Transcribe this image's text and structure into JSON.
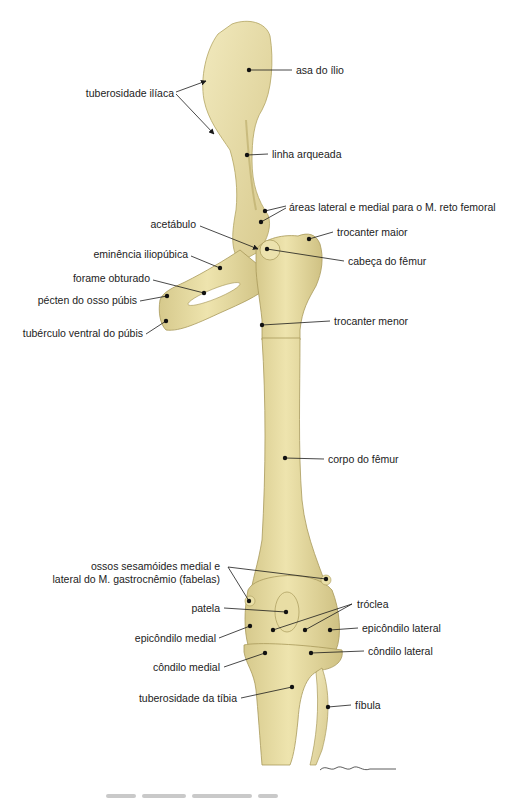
{
  "figure": {
    "colors": {
      "bone_fill": "#ebe0a6",
      "bone_shade": "#c8b978",
      "bone_edge": "#a8995a",
      "leader": "#1a1a1a",
      "text": "#222222",
      "background": "#ffffff"
    },
    "labels": [
      {
        "id": "asa-do-ilio",
        "text": "asa do ílio"
      },
      {
        "id": "tuberosidade-iliaca",
        "text": "tuberosidade ilíaca"
      },
      {
        "id": "linha-arqueada",
        "text": "linha arqueada"
      },
      {
        "id": "areas-reto-femoral",
        "text": "áreas lateral e medial para o M. reto femoral"
      },
      {
        "id": "acetabulo",
        "text": "acetábulo"
      },
      {
        "id": "trocanter-maior",
        "text": "trocanter maior"
      },
      {
        "id": "eminencia-iliopubica",
        "text": "eminência iliopúbica"
      },
      {
        "id": "cabeca-do-femur",
        "text": "cabeça do fêmur"
      },
      {
        "id": "forame-obturado",
        "text": "forame obturado"
      },
      {
        "id": "pecten-osso-pubis",
        "text": "pécten do osso púbis"
      },
      {
        "id": "tuberculo-ventral-pubis",
        "text": "tubérculo ventral do púbis"
      },
      {
        "id": "trocanter-menor",
        "text": "trocanter menor"
      },
      {
        "id": "corpo-do-femur",
        "text": "corpo do fêmur"
      },
      {
        "id": "ossos-sesamoides-1",
        "text": "ossos sesamóides medial e"
      },
      {
        "id": "ossos-sesamoides-2",
        "text": "lateral do M. gastrocnêmio (fabelas)"
      },
      {
        "id": "patela",
        "text": "patela"
      },
      {
        "id": "troclea",
        "text": "tróclea"
      },
      {
        "id": "epicondilo-medial",
        "text": "epicôndilo medial"
      },
      {
        "id": "epicondilo-lateral",
        "text": "epicôndilo lateral"
      },
      {
        "id": "condilo-lateral",
        "text": "côndilo lateral"
      },
      {
        "id": "condilo-medial",
        "text": "côndilo medial"
      },
      {
        "id": "tuberosidade-da-tibia",
        "text": "tuberosidade da tíbia"
      },
      {
        "id": "fibula",
        "text": "fíbula"
      }
    ],
    "signature": "artist signature (illegible)",
    "caption": "cropped caption (illegible)"
  }
}
